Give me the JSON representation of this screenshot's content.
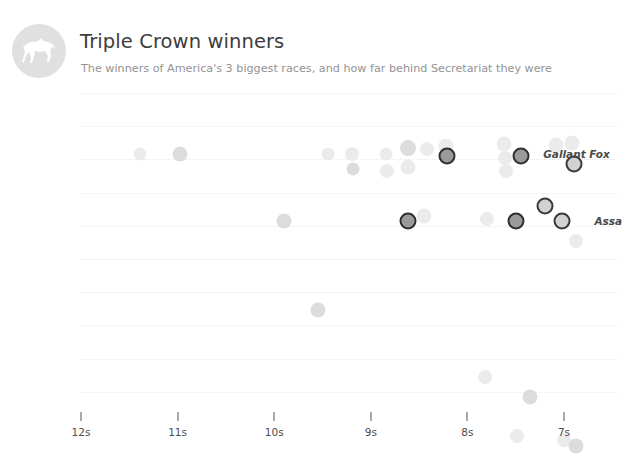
{
  "header": {
    "title": "Triple Crown winners",
    "subtitle": "The winners of America's 3 biggest races, and how far behind Secretariat they were",
    "logo_icon": "horse-icon"
  },
  "chart_data": {
    "type": "scatter",
    "title": "Triple Crown winners",
    "subtitle": "The winners of America's 3 biggest races, and how far behind Secretariat they were",
    "xlabel": "",
    "ylabel": "",
    "grid": true,
    "legend": false,
    "xlim": [
      12.5,
      6.5
    ],
    "x_axis_direction": "decreasing",
    "x_tick_labels": [
      "12s",
      "11s",
      "10s",
      "9s",
      "8s",
      "7s"
    ],
    "x_tick_values": [
      12,
      11,
      10,
      9,
      8,
      7
    ],
    "y_gridline_count": 10,
    "annotations": [
      {
        "label": "Gallant Fox",
        "x": 7.35,
        "y_row": 1
      },
      {
        "label": "Assa",
        "x": 6.82,
        "y_row": 3,
        "clipped": true
      }
    ],
    "points": [
      {
        "x": 11.39,
        "y_row": 1,
        "style": "faint",
        "r": 6.5
      },
      {
        "x": 10.98,
        "y_row": 1,
        "style": "mid",
        "r": 7.5
      },
      {
        "x": 9.44,
        "y_row": 1,
        "style": "faint",
        "r": 6.5
      },
      {
        "x": 9.19,
        "y_row": 1,
        "style": "faint",
        "r": 7
      },
      {
        "x": 9.18,
        "y_row": 1.45,
        "style": "mid",
        "r": 6.5
      },
      {
        "x": 8.84,
        "y_row": 1,
        "style": "faint",
        "r": 6.5
      },
      {
        "x": 8.83,
        "y_row": 1.5,
        "style": "faint",
        "r": 7
      },
      {
        "x": 8.62,
        "y_row": 0.8,
        "style": "mid",
        "r": 8
      },
      {
        "x": 8.61,
        "y_row": 1.4,
        "style": "faint",
        "r": 7.5
      },
      {
        "x": 8.42,
        "y_row": 0.85,
        "style": "faint",
        "r": 7
      },
      {
        "x": 8.22,
        "y_row": 0.75,
        "style": "faint",
        "r": 7.5
      },
      {
        "x": 8.21,
        "y_row": 1.05,
        "style": "hi",
        "r": 8.5
      },
      {
        "x": 7.62,
        "y_row": 0.7,
        "style": "faint",
        "r": 7.5
      },
      {
        "x": 7.61,
        "y_row": 1.1,
        "style": "faint",
        "r": 7
      },
      {
        "x": 7.6,
        "y_row": 1.5,
        "style": "faint",
        "r": 7
      },
      {
        "x": 7.44,
        "y_row": 1.05,
        "style": "hi",
        "r": 8.5
      },
      {
        "x": 7.08,
        "y_row": 0.72,
        "style": "faint",
        "r": 7.5
      },
      {
        "x": 6.92,
        "y_row": 0.65,
        "style": "faint",
        "r": 7.5
      },
      {
        "x": 6.9,
        "y_row": 1.3,
        "style": "hi-light",
        "r": 8.5
      },
      {
        "x": 9.9,
        "y_row": 3,
        "style": "mid",
        "r": 7.5
      },
      {
        "x": 8.62,
        "y_row": 3,
        "style": "hi",
        "r": 8.5
      },
      {
        "x": 8.45,
        "y_row": 2.85,
        "style": "faint",
        "r": 7.5
      },
      {
        "x": 7.8,
        "y_row": 2.95,
        "style": "faint",
        "r": 7
      },
      {
        "x": 7.5,
        "y_row": 3,
        "style": "hi",
        "r": 8.5
      },
      {
        "x": 7.2,
        "y_row": 2.55,
        "style": "hi-light",
        "r": 8.5
      },
      {
        "x": 7.02,
        "y_row": 3,
        "style": "hi-light",
        "r": 8.5
      },
      {
        "x": 6.88,
        "y_row": 3.6,
        "style": "faint",
        "r": 7
      },
      {
        "x": 9.55,
        "y_row": 5.7,
        "style": "mid",
        "r": 7.5
      },
      {
        "x": 7.82,
        "y_row": 7.7,
        "style": "faint",
        "r": 7
      },
      {
        "x": 7.35,
        "y_row": 8.3,
        "style": "mid",
        "r": 7.5
      },
      {
        "x": 7.49,
        "y_row": 9.5,
        "style": "faint",
        "r": 7
      },
      {
        "x": 7.0,
        "y_row": 9.6,
        "style": "faint",
        "r": 7
      },
      {
        "x": 6.88,
        "y_row": 9.8,
        "style": "mid",
        "r": 7.5
      }
    ]
  },
  "colors": {
    "title": "#3d3d3d",
    "subtitle": "#939393",
    "gridline": "#e9e9e9",
    "highlight_outline": "#2f2f2f",
    "dot_faint": "#ebebeb",
    "dot_mid": "#dcdcdc",
    "badge": "#e0e0e0",
    "background": "#ffffff"
  }
}
